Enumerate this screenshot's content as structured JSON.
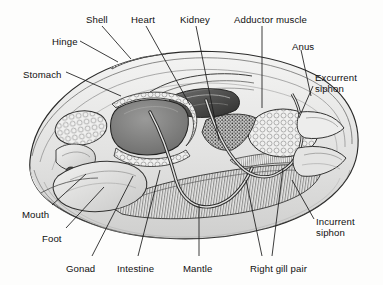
{
  "figure": {
    "background_color": "#fdfdfc",
    "line_color": "#1a1a1a",
    "label_color": "#101010"
  },
  "labels": [
    {
      "id": "shell",
      "text": "Shell",
      "x": 86,
      "y": 14
    },
    {
      "id": "heart",
      "text": "Heart",
      "x": 131,
      "y": 14
    },
    {
      "id": "kidney",
      "text": "Kidney",
      "x": 180,
      "y": 14
    },
    {
      "id": "adductor-muscle",
      "text": "Adductor muscle",
      "x": 234,
      "y": 14
    },
    {
      "id": "hinge",
      "text": "Hinge",
      "x": 52,
      "y": 36
    },
    {
      "id": "anus",
      "text": "Anus",
      "x": 292,
      "y": 41
    },
    {
      "id": "stomach",
      "text": "Stomach",
      "x": 23,
      "y": 69
    },
    {
      "id": "excurrent-siphon",
      "text": "Excurrent\nsiphon",
      "x": 315,
      "y": 72
    },
    {
      "id": "mouth",
      "text": "Mouth",
      "x": 22,
      "y": 209
    },
    {
      "id": "incurrent-siphon",
      "text": "Incurrent\nsiphon",
      "x": 316,
      "y": 216
    },
    {
      "id": "foot",
      "text": "Foot",
      "x": 42,
      "y": 233
    },
    {
      "id": "gonad",
      "text": "Gonad",
      "x": 66,
      "y": 263
    },
    {
      "id": "intestine",
      "text": "Intestine",
      "x": 117,
      "y": 263
    },
    {
      "id": "mantle",
      "text": "Mantle",
      "x": 183,
      "y": 263
    },
    {
      "id": "right-gill-pair",
      "text": "Right gill pair",
      "x": 250,
      "y": 263
    }
  ],
  "leader_lines": [
    {
      "id": "shell-leader",
      "points": "102,26 131,59"
    },
    {
      "id": "heart-leader",
      "points": "146,26 190,105"
    },
    {
      "id": "kidney-leader",
      "points": "196,26 219,140"
    },
    {
      "id": "adductor-leader",
      "points": "262,26 262,108"
    },
    {
      "id": "hinge-leader",
      "points": "80,41 118,62"
    },
    {
      "id": "anus-leader",
      "points": "301,50 311,96"
    },
    {
      "id": "stomach-leader",
      "points": "66,72 121,96"
    },
    {
      "id": "excurrent-leader-a",
      "points": "313,86 299,118"
    },
    {
      "id": "incurrent-leader",
      "points": "314,219 292,180"
    },
    {
      "id": "mouth-leader",
      "points": "52,205 86,174"
    },
    {
      "id": "foot-leader",
      "points": "66,228 104,187"
    },
    {
      "id": "gonad-leader",
      "points": "92,256 133,176"
    },
    {
      "id": "intestine-leader",
      "points": "138,256 160,170"
    },
    {
      "id": "mantle-leader",
      "points": "199,256 199,205"
    },
    {
      "id": "gill-leader-a",
      "points": "262,256 246,180"
    },
    {
      "id": "gill-leader-b",
      "points": "272,256 283,168"
    }
  ],
  "structures": [
    {
      "id": "shell-outline",
      "name": "shell-outline"
    },
    {
      "id": "mantle-margin",
      "name": "mantle-margin"
    },
    {
      "id": "gonad-mass",
      "name": "gonad-mass"
    },
    {
      "id": "stomach-cavity",
      "name": "stomach-cavity"
    },
    {
      "id": "foot-mass",
      "name": "foot-mass"
    },
    {
      "id": "labial-palps",
      "name": "labial-palps"
    },
    {
      "id": "intestine-loop",
      "name": "intestine-loop"
    },
    {
      "id": "heart-region",
      "name": "heart-region"
    },
    {
      "id": "kidney-region",
      "name": "kidney-region"
    },
    {
      "id": "adductor-muscle",
      "name": "adductor-muscle-mass"
    },
    {
      "id": "gill-filaments",
      "name": "gill-filaments"
    },
    {
      "id": "siphon-flaps",
      "name": "siphon-flaps"
    },
    {
      "id": "hinge-ligament",
      "name": "hinge-ligament"
    }
  ]
}
